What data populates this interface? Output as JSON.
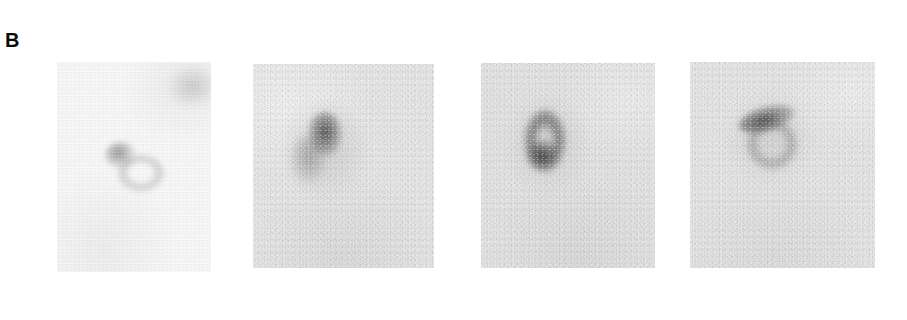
{
  "figure": {
    "panel_label": "B",
    "background_color": "#ffffff",
    "label_color": "#0b0b0b",
    "type": "autoradiograph-blot-series",
    "panel_count": 4
  },
  "blots": [
    {
      "index": 1,
      "name": "blot-panel-1",
      "background_color": "#fbfbfb",
      "intensity": "very-faint",
      "features": [
        {
          "name": "spot-main",
          "shape": "round-blob",
          "darkness": "medium"
        },
        {
          "name": "spot-ring",
          "shape": "ring",
          "darkness": "faint"
        },
        {
          "name": "spot-smudge",
          "shape": "diffuse",
          "darkness": "very-faint"
        }
      ]
    },
    {
      "index": 2,
      "name": "blot-panel-2",
      "background_color": "#e3e3e3",
      "intensity": "strong",
      "features": [
        {
          "name": "spot-core",
          "shape": "vertical-oval",
          "darkness": "dark"
        },
        {
          "name": "spot-tail",
          "shape": "diffuse-tail",
          "darkness": "medium"
        },
        {
          "name": "spot-halo",
          "shape": "halo",
          "darkness": "faint"
        }
      ]
    },
    {
      "index": 3,
      "name": "blot-panel-3",
      "background_color": "#e0e0e0",
      "intensity": "strong",
      "features": [
        {
          "name": "spot-ring",
          "shape": "vertical-ring",
          "darkness": "medium"
        },
        {
          "name": "spot-core",
          "shape": "round-blob",
          "darkness": "dark"
        },
        {
          "name": "spot-halo",
          "shape": "halo",
          "darkness": "faint"
        }
      ]
    },
    {
      "index": 4,
      "name": "blot-panel-4",
      "background_color": "#e2e2e2",
      "intensity": "strong",
      "features": [
        {
          "name": "spot-bar",
          "shape": "angled-crescent",
          "darkness": "dark"
        },
        {
          "name": "spot-ring",
          "shape": "ring",
          "darkness": "medium"
        },
        {
          "name": "spot-halo",
          "shape": "halo",
          "darkness": "faint"
        }
      ]
    }
  ]
}
